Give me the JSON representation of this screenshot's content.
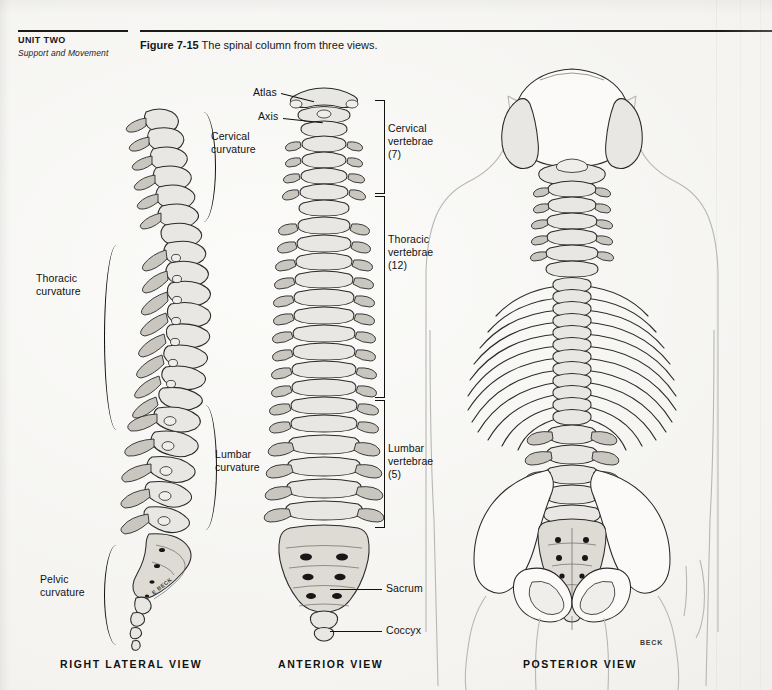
{
  "page": {
    "unit_label": "UNIT TWO",
    "unit_subtitle": "Support and Movement",
    "background_color": "#f4f3f0",
    "ink_color": "#111111"
  },
  "figure": {
    "number": "Figure 7-15",
    "caption": "The spinal column from three views.",
    "artist_signature": "BECK",
    "artist_signature_lateral": "E BECK"
  },
  "views": [
    {
      "id": "lateral",
      "caption": "RIGHT LATERAL VIEW"
    },
    {
      "id": "anterior",
      "caption": "ANTERIOR VIEW"
    },
    {
      "id": "posterior",
      "caption": "POSTERIOR VIEW"
    }
  ],
  "lateral_labels": [
    {
      "id": "cervical-curvature",
      "text": "Cervical\ncurvature"
    },
    {
      "id": "thoracic-curvature",
      "text": "Thoracic\ncurvature"
    },
    {
      "id": "lumbar-curvature",
      "text": "Lumbar\ncurvature"
    },
    {
      "id": "pelvic-curvature",
      "text": "Pelvic\ncurvature"
    }
  ],
  "anterior_labels": [
    {
      "id": "atlas",
      "text": "Atlas"
    },
    {
      "id": "axis",
      "text": "Axis"
    },
    {
      "id": "sacrum",
      "text": "Sacrum"
    },
    {
      "id": "coccyx",
      "text": "Coccyx"
    }
  ],
  "anterior_brackets": [
    {
      "id": "cervical-vertebrae",
      "text": "Cervical\nvertebrae\n(7)",
      "count": 7
    },
    {
      "id": "thoracic-vertebrae",
      "text": "Thoracic\nvertebrae\n(12)",
      "count": 12
    },
    {
      "id": "lumbar-vertebrae",
      "text": "Lumbar\nvertebrae\n(5)",
      "count": 5
    }
  ]
}
